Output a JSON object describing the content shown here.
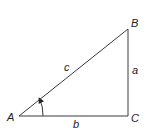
{
  "diagram": {
    "type": "right-triangle",
    "colors": {
      "stroke": "#3a3a3a",
      "text": "#222222",
      "background": "#ffffff"
    },
    "vertices": {
      "A": {
        "label": "A"
      },
      "B": {
        "label": "B"
      },
      "C": {
        "label": "C"
      }
    },
    "sides": {
      "hypotenuse": {
        "label": "c"
      },
      "opposite": {
        "label": "a"
      },
      "adjacent": {
        "label": "b"
      }
    },
    "angle_marker": {
      "at": "A",
      "icon": "arc-arrow-icon"
    }
  }
}
